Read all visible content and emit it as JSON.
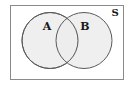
{
  "diagram": {
    "type": "venn",
    "universal_set": {
      "label": "S",
      "rect": {
        "x": 10.5,
        "y": 5.5,
        "width": 113,
        "height": 74
      },
      "stroke": "#8a8a8a",
      "fill": "#ffffff"
    },
    "sets": [
      {
        "label": "A",
        "cx": 50,
        "cy": 40.5,
        "r": 28,
        "fill": "#ececec",
        "stroke": "#5a5a5a",
        "label_x": 47,
        "label_y": 30
      },
      {
        "label": "B",
        "cx": 84,
        "cy": 40.5,
        "r": 28,
        "fill": "#ececec",
        "stroke": "#5a5a5a",
        "label_x": 85,
        "label_y": 30
      }
    ],
    "universal_label_pos": {
      "x": 115,
      "y": 16
    }
  }
}
